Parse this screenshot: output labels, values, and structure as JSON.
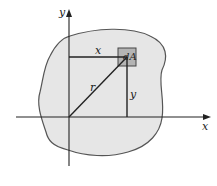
{
  "diagram": {
    "colors": {
      "region_fill": "#e6e6e6",
      "region_stroke": "#555555",
      "element_fill": "#b4b4b4",
      "line": "#222222"
    },
    "labels": {
      "y_axis": "y",
      "x_axis": "x",
      "x_distance": "x",
      "y_distance": "y",
      "radius": "r",
      "element": "dA"
    }
  }
}
